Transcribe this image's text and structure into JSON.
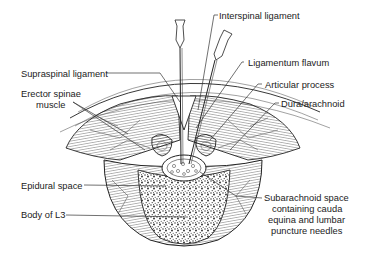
{
  "diagram": {
    "labels": {
      "interspinal": "Interspinal ligament",
      "supraspinal": "Supraspinal ligament",
      "flavum": "Ligamentum flavum",
      "erector_1": "Erector spinae",
      "erector_2": "muscle",
      "articular": "Articular process",
      "dura": "Dura/arachnoid",
      "epidural": "Epidural space",
      "body": "Body of L3",
      "subarachnoid_1": "Subarachnoid space",
      "subarachnoid_2": "containing cauda",
      "subarachnoid_3": "equina and lumbar",
      "subarachnoid_4": "puncture needles"
    },
    "colors": {
      "ink": "#222222",
      "background": "#ffffff"
    }
  }
}
